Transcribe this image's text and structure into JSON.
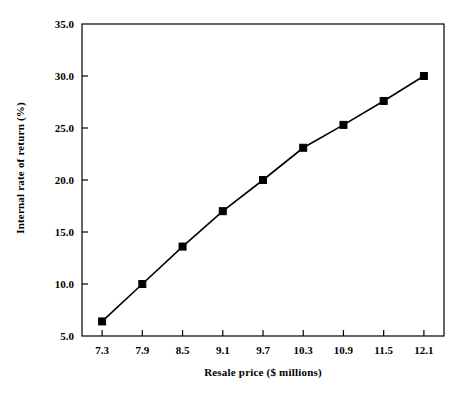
{
  "chart_data": {
    "type": "line",
    "title": "",
    "xlabel": "Resale price ($ millions)",
    "ylabel": "Internal rate of return (%)",
    "x": [
      7.3,
      7.9,
      8.5,
      9.1,
      9.7,
      10.3,
      10.9,
      11.5,
      12.1
    ],
    "values": [
      6.4,
      10.0,
      13.6,
      17.0,
      20.0,
      23.1,
      25.3,
      27.6,
      30.0
    ],
    "series": [
      {
        "name": "Internal rate of return",
        "values": [
          6.4,
          10.0,
          13.6,
          17.0,
          20.0,
          23.1,
          25.3,
          27.6,
          30.0
        ],
        "marker": "square",
        "color": "#000000"
      }
    ],
    "xtick_labels": [
      "7.3",
      "7.9",
      "8.5",
      "9.1",
      "9.7",
      "10.3",
      "10.9",
      "11.5",
      "12.1"
    ],
    "ytick_labels": [
      "5.0",
      "10.0",
      "15.0",
      "20.0",
      "25.0",
      "30.0",
      "35.0"
    ],
    "ytick_values": [
      5.0,
      10.0,
      15.0,
      20.0,
      25.0,
      30.0,
      35.0
    ],
    "ylim": [
      5.0,
      35.0
    ],
    "xlim_index": [
      0,
      8
    ],
    "grid": false,
    "legend": "none",
    "line_color": "#000000",
    "marker_color": "#000000",
    "frame_color": "#000000",
    "background": "#ffffff"
  }
}
